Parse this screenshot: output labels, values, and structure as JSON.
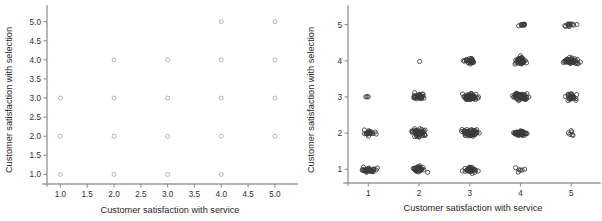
{
  "figure": {
    "width": 602,
    "height": 221,
    "background": "#ffffff",
    "panel_count": 2,
    "marker_shape": "open-circle"
  },
  "chart_data": [
    {
      "id": "left-panel",
      "type": "scatter",
      "title": "",
      "xlabel": "Customer satisfaction with service",
      "ylabel": "Customer satisfaction with selection",
      "xlim": [
        0.75,
        5.3
      ],
      "ylim": [
        0.75,
        5.25
      ],
      "xticks": [
        1.0,
        1.5,
        2.0,
        2.5,
        3.0,
        3.5,
        4.0,
        4.5,
        5.0
      ],
      "yticks": [
        1.0,
        1.5,
        2.0,
        2.5,
        3.0,
        3.5,
        4.0,
        4.5,
        5.0
      ],
      "xticklabels": [
        "1.0",
        "1.5",
        "2.0",
        "2.5",
        "3.0",
        "3.5",
        "4.0",
        "4.5",
        "5.0"
      ],
      "yticklabels": [
        "1.0",
        "1.5",
        "2.0",
        "2.5",
        "3.0",
        "3.5",
        "4.0",
        "4.5",
        "5.0"
      ],
      "grid": false,
      "legend": "none",
      "jittered": false,
      "marker_color": "#a8a8a8",
      "note": "Overplotted integer-valued data; each visible circle is one lattice position that may hide many observations.",
      "points": [
        {
          "x": 1,
          "y": 1
        },
        {
          "x": 1,
          "y": 2
        },
        {
          "x": 1,
          "y": 3
        },
        {
          "x": 2,
          "y": 1
        },
        {
          "x": 2,
          "y": 2
        },
        {
          "x": 2,
          "y": 3
        },
        {
          "x": 2,
          "y": 4
        },
        {
          "x": 3,
          "y": 1
        },
        {
          "x": 3,
          "y": 2
        },
        {
          "x": 3,
          "y": 3
        },
        {
          "x": 3,
          "y": 4
        },
        {
          "x": 4,
          "y": 1
        },
        {
          "x": 4,
          "y": 2
        },
        {
          "x": 4,
          "y": 3
        },
        {
          "x": 4,
          "y": 4
        },
        {
          "x": 4,
          "y": 5
        },
        {
          "x": 5,
          "y": 2
        },
        {
          "x": 5,
          "y": 3
        },
        {
          "x": 5,
          "y": 4
        },
        {
          "x": 5,
          "y": 5
        }
      ]
    },
    {
      "id": "right-panel",
      "type": "scatter",
      "title": "",
      "xlabel": "Customer satisfaction with service",
      "ylabel": "Customer satisfaction with selection",
      "xlim": [
        0.6,
        5.45
      ],
      "ylim": [
        0.62,
        5.35
      ],
      "xticks": [
        1,
        2,
        3,
        4,
        5
      ],
      "yticks": [
        1,
        2,
        3,
        4,
        5
      ],
      "xticklabels": [
        "1",
        "2",
        "3",
        "4",
        "5"
      ],
      "yticklabels": [
        "1",
        "2",
        "3",
        "4",
        "5"
      ],
      "grid": false,
      "legend": "none",
      "jittered": true,
      "marker_color": "#3a3a3a",
      "note": "Same data with random jitter added so that cluster density reveals how many observations sit at each integer pair.",
      "clusters": [
        {
          "x": 1,
          "y": 1,
          "count": 34,
          "spread_x": 0.16,
          "spread_y": 0.075
        },
        {
          "x": 1,
          "y": 2,
          "count": 22,
          "spread_x": 0.11,
          "spread_y": 0.085
        },
        {
          "x": 1,
          "y": 3,
          "count": 3,
          "spread_x": 0.09,
          "spread_y": 0.055
        },
        {
          "x": 2,
          "y": 1,
          "count": 40,
          "spread_x": 0.13,
          "spread_y": 0.07
        },
        {
          "x": 2,
          "y": 2,
          "count": 52,
          "spread_x": 0.15,
          "spread_y": 0.095
        },
        {
          "x": 2,
          "y": 3,
          "count": 32,
          "spread_x": 0.11,
          "spread_y": 0.085
        },
        {
          "x": 2,
          "y": 4,
          "count": 1,
          "spread_x": 0.05,
          "spread_y": 0.04
        },
        {
          "x": 3,
          "y": 1,
          "count": 40,
          "spread_x": 0.12,
          "spread_y": 0.085
        },
        {
          "x": 3,
          "y": 2,
          "count": 58,
          "spread_x": 0.16,
          "spread_y": 0.08
        },
        {
          "x": 3,
          "y": 3,
          "count": 62,
          "spread_x": 0.13,
          "spread_y": 0.08
        },
        {
          "x": 3,
          "y": 4,
          "count": 26,
          "spread_x": 0.12,
          "spread_y": 0.075
        },
        {
          "x": 4,
          "y": 1,
          "count": 6,
          "spread_x": 0.1,
          "spread_y": 0.065
        },
        {
          "x": 4,
          "y": 2,
          "count": 44,
          "spread_x": 0.13,
          "spread_y": 0.075
        },
        {
          "x": 4,
          "y": 3,
          "count": 56,
          "spread_x": 0.14,
          "spread_y": 0.095
        },
        {
          "x": 4,
          "y": 4,
          "count": 38,
          "spread_x": 0.12,
          "spread_y": 0.095
        },
        {
          "x": 4,
          "y": 5,
          "count": 10,
          "spread_x": 0.09,
          "spread_y": 0.04
        },
        {
          "x": 5,
          "y": 2,
          "count": 6,
          "spread_x": 0.09,
          "spread_y": 0.07
        },
        {
          "x": 5,
          "y": 3,
          "count": 26,
          "spread_x": 0.1,
          "spread_y": 0.09
        },
        {
          "x": 5,
          "y": 4,
          "count": 42,
          "spread_x": 0.13,
          "spread_y": 0.085
        },
        {
          "x": 5,
          "y": 5,
          "count": 12,
          "spread_x": 0.1,
          "spread_y": 0.055
        }
      ]
    }
  ]
}
